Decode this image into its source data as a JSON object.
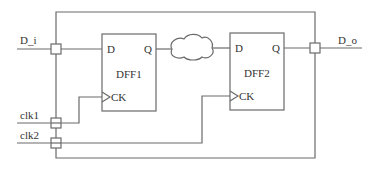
{
  "diagram": {
    "type": "circuit-schematic",
    "inputs": [
      {
        "id": "D_i",
        "label": "D_i"
      },
      {
        "id": "clk1",
        "label": "clk1"
      },
      {
        "id": "clk2",
        "label": "clk2"
      }
    ],
    "outputs": [
      {
        "id": "D_o",
        "label": "D_o"
      }
    ],
    "flip_flops": [
      {
        "id": "DFF1",
        "name": "DFF1",
        "pin_d": "D",
        "pin_q": "Q",
        "pin_ck": "CK"
      },
      {
        "id": "DFF2",
        "name": "DFF2",
        "pin_d": "D",
        "pin_q": "Q",
        "pin_ck": "CK"
      }
    ],
    "combinational_logic": {
      "shape": "cloud",
      "between": [
        "DFF1.Q",
        "DFF2.D"
      ]
    },
    "colors": {
      "line": "#6a6a6a",
      "text": "#333333",
      "background": "#ffffff"
    }
  }
}
